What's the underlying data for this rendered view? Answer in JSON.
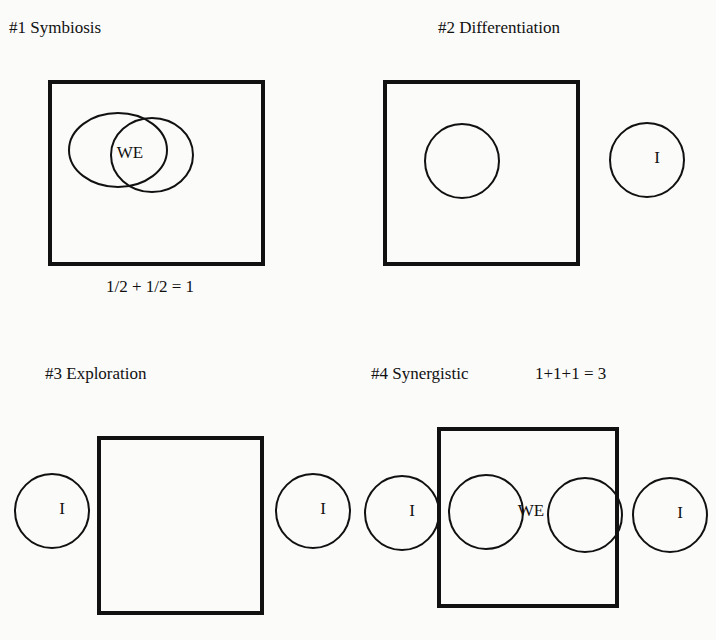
{
  "panels": [
    {
      "id": "symbiosis",
      "title": "#1  Symbiosis",
      "title_pos": [
        9,
        28
      ],
      "equation": "1/2  + 1/2   = 1",
      "equation_pos": [
        106,
        287
      ],
      "box": {
        "x": 50,
        "y": 82,
        "w": 213,
        "h": 182
      },
      "circles": [
        {
          "cx": 118,
          "cy": 150,
          "rx": 49,
          "ry": 37,
          "label": ""
        },
        {
          "cx": 152,
          "cy": 155,
          "rx": 41,
          "ry": 37,
          "label": ""
        }
      ],
      "text_labels": [
        {
          "text": "WE",
          "x": 130,
          "y": 153
        }
      ]
    },
    {
      "id": "differentiation",
      "title": "#2 Differentiation",
      "title_pos": [
        438,
        28
      ],
      "equation": "",
      "box": {
        "x": 385,
        "y": 82,
        "w": 193,
        "h": 182
      },
      "circles": [
        {
          "cx": 462,
          "cy": 161,
          "rx": 37,
          "ry": 37,
          "label": ""
        },
        {
          "cx": 647,
          "cy": 160,
          "rx": 37,
          "ry": 37,
          "label": "I"
        }
      ],
      "text_labels": []
    },
    {
      "id": "exploration",
      "title": "#3  Exploration",
      "title_pos": [
        45,
        374
      ],
      "equation": "",
      "box": {
        "x": 99,
        "y": 438,
        "w": 163,
        "h": 175
      },
      "circles": [
        {
          "cx": 52,
          "cy": 511,
          "rx": 37,
          "ry": 37,
          "label": "I"
        },
        {
          "cx": 313,
          "cy": 511,
          "rx": 37,
          "ry": 37,
          "label": "I"
        }
      ],
      "text_labels": []
    },
    {
      "id": "synergistic",
      "title": "#4  Synergistic",
      "title_pos": [
        371,
        374
      ],
      "equation": "1+1+1  = 3",
      "equation_pos": [
        535,
        374
      ],
      "box": {
        "x": 439,
        "y": 429,
        "w": 178,
        "h": 177
      },
      "circles": [
        {
          "cx": 402,
          "cy": 513,
          "rx": 37,
          "ry": 37,
          "label": "I"
        },
        {
          "cx": 486,
          "cy": 512,
          "rx": 37,
          "ry": 37,
          "label": ""
        },
        {
          "cx": 585,
          "cy": 515,
          "rx": 37,
          "ry": 37,
          "label": ""
        },
        {
          "cx": 670,
          "cy": 515,
          "rx": 37,
          "ry": 37,
          "label": "I"
        }
      ],
      "text_labels": [
        {
          "text": "WE",
          "x": 531,
          "y": 511
        }
      ]
    }
  ],
  "style": {
    "stroke": "#111111",
    "box_stroke_width": 4,
    "circle_stroke_width": 2,
    "background": "#fbfbfa"
  }
}
